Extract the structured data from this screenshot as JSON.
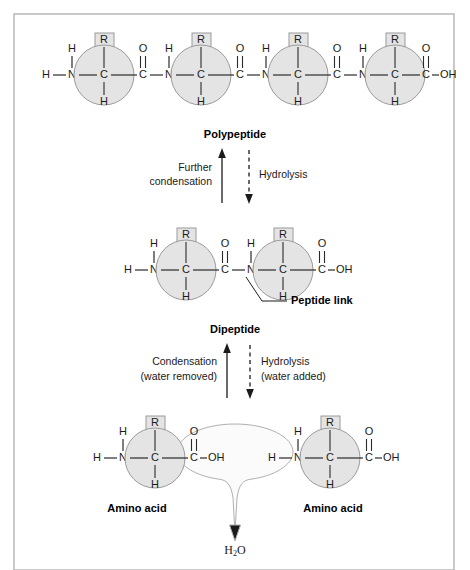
{
  "figure": {
    "frame_color": "#b3b3b3",
    "residue_fill": "#e4e4e4",
    "residue_stroke": "#9a9a9a",
    "bond_color": "#2a2a2a"
  },
  "atoms": {
    "H": "H",
    "N": "N",
    "C": "C",
    "O": "O",
    "R": "R",
    "OH": "OH"
  },
  "rows": {
    "polypeptide": {
      "label": "Polypeptide",
      "units": 4,
      "terminus_left": "H",
      "terminus_right": "OH"
    },
    "dipeptide": {
      "label": "Dipeptide",
      "units": 2,
      "terminus_left": "H",
      "terminus_right": "OH",
      "annotation": "Peptide link"
    },
    "amino_acids": {
      "left_label": "Amino acid",
      "right_label": "Amino acid",
      "units": 2,
      "terminus_left": "H",
      "terminus_right": "OH",
      "water_label": "H",
      "water_sub": "2",
      "water_label_tail": "O"
    }
  },
  "arrows": {
    "upper": {
      "left_line1": "Further",
      "left_line2": "condensation",
      "right_line1": "Hydrolysis",
      "right_line2": "",
      "left_direction": "up",
      "right_direction": "down",
      "left_style": "solid",
      "right_style": "dashed"
    },
    "lower": {
      "left_line1": "Condensation",
      "left_line2": "(water removed)",
      "right_line1": "Hydrolysis",
      "right_line2": "(water added)",
      "left_direction": "up",
      "right_direction": "down",
      "left_style": "solid",
      "right_style": "dashed"
    }
  }
}
